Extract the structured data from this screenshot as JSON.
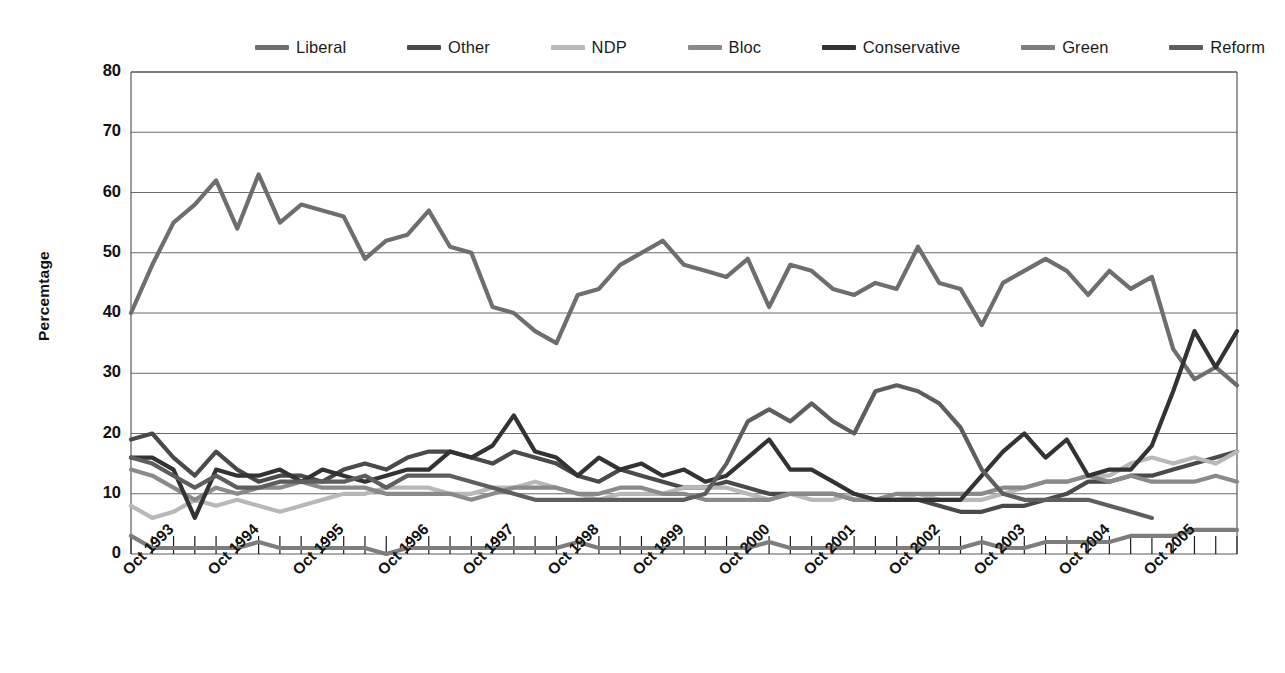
{
  "legend": {
    "position": "top",
    "items": [
      {
        "label": "Liberal",
        "color": "#6e6e6e"
      },
      {
        "label": "Other",
        "color": "#4a4a4a"
      },
      {
        "label": "NDP",
        "color": "#b8b8b8"
      },
      {
        "label": "Bloc",
        "color": "#8a8a8a"
      },
      {
        "label": "Conservative",
        "color": "#333333"
      },
      {
        "label": "Green",
        "color": "#7d7d7d"
      },
      {
        "label": "Reform",
        "color": "#5e5e5e"
      }
    ]
  },
  "axes": {
    "y_title": "Percemtage",
    "y_ticks": [
      "0",
      "10",
      "20",
      "30",
      "40",
      "50",
      "60",
      "70",
      "80"
    ],
    "x_ticks": [
      "Oct 1993",
      "Oct 1994",
      "Oct 1995",
      "Oct 1996",
      "Oct 1997",
      "Oct 1998",
      "Oct 1999",
      "Oct 2000",
      "Oct 2001",
      "Oct 2002",
      "Oct 2003",
      "Oct 2004",
      "Oct 2005"
    ]
  },
  "chart_data": {
    "type": "line",
    "title": "",
    "xlabel": "",
    "ylabel": "Percemtage",
    "ylim": [
      0,
      80
    ],
    "ytick_step": 10,
    "grid": true,
    "legend_position": "top",
    "x_tick_labels": [
      "Oct 1993",
      "Oct 1994",
      "Oct 1995",
      "Oct 1996",
      "Oct 1997",
      "Oct 1998",
      "Oct 1999",
      "Oct 2000",
      "Oct 2001",
      "Oct 2002",
      "Oct 2003",
      "Oct 2004",
      "Oct 2005"
    ],
    "x_sample_interval": "quarterly",
    "x_count": 53,
    "series": [
      {
        "name": "Liberal",
        "color": "#6e6e6e",
        "values": [
          40,
          48,
          55,
          58,
          62,
          54,
          63,
          55,
          58,
          57,
          56,
          49,
          52,
          53,
          57,
          51,
          50,
          41,
          40,
          37,
          35,
          43,
          44,
          48,
          50,
          52,
          48,
          47,
          46,
          49,
          41,
          48,
          47,
          44,
          43,
          45,
          44,
          51,
          45,
          44,
          38,
          45,
          47,
          49,
          47,
          43,
          47,
          44,
          46,
          34,
          29,
          31,
          28
        ]
      },
      {
        "name": "Other",
        "color": "#4a4a4a",
        "values": [
          19,
          20,
          16,
          13,
          17,
          14,
          12,
          13,
          13,
          12,
          14,
          15,
          14,
          16,
          17,
          17,
          16,
          15,
          17,
          16,
          15,
          13,
          12,
          14,
          13,
          12,
          11,
          11,
          12,
          11,
          10,
          10,
          10,
          10,
          9,
          9,
          9,
          9,
          8,
          7,
          7,
          8,
          8,
          9,
          10,
          12,
          12,
          13,
          13,
          14,
          15,
          16,
          17
        ]
      },
      {
        "name": "NDP",
        "color": "#b8b8b8",
        "values": [
          8,
          6,
          7,
          9,
          8,
          9,
          8,
          7,
          8,
          9,
          10,
          10,
          11,
          11,
          11,
          10,
          10,
          11,
          11,
          12,
          11,
          10,
          9,
          10,
          10,
          10,
          11,
          11,
          11,
          10,
          9,
          10,
          9,
          9,
          10,
          9,
          9,
          10,
          9,
          9,
          9,
          10,
          11,
          12,
          12,
          13,
          13,
          15,
          16,
          15,
          16,
          15,
          17
        ]
      },
      {
        "name": "Bloc",
        "color": "#8a8a8a",
        "values": [
          14,
          13,
          11,
          9,
          11,
          10,
          11,
          11,
          12,
          11,
          11,
          11,
          10,
          10,
          10,
          10,
          9,
          10,
          11,
          11,
          11,
          10,
          10,
          11,
          11,
          10,
          10,
          9,
          9,
          9,
          9,
          10,
          10,
          10,
          9,
          9,
          10,
          10,
          10,
          10,
          10,
          11,
          11,
          12,
          12,
          13,
          12,
          13,
          12,
          12,
          12,
          13,
          12
        ]
      },
      {
        "name": "Conservative",
        "color": "#333333",
        "values": [
          16,
          16,
          14,
          6,
          14,
          13,
          13,
          14,
          12,
          14,
          13,
          12,
          13,
          14,
          14,
          17,
          16,
          18,
          23,
          17,
          16,
          13,
          16,
          14,
          15,
          13,
          14,
          12,
          13,
          16,
          19,
          14,
          14,
          12,
          10,
          9,
          9,
          9,
          9,
          9,
          13,
          17,
          20,
          16,
          19,
          13,
          14,
          14,
          18,
          27,
          37,
          31,
          37
        ]
      },
      {
        "name": "Green",
        "color": "#7d7d7d",
        "values": [
          3,
          1,
          1,
          1,
          1,
          1,
          2,
          1,
          1,
          1,
          1,
          1,
          0,
          1,
          1,
          1,
          1,
          1,
          1,
          1,
          1,
          2,
          1,
          1,
          1,
          1,
          1,
          1,
          1,
          1,
          2,
          1,
          1,
          1,
          1,
          1,
          1,
          1,
          1,
          1,
          2,
          1,
          1,
          2,
          2,
          2,
          2,
          3,
          3,
          3,
          4,
          4,
          4
        ]
      },
      {
        "name": "Reform",
        "color": "#5e5e5e",
        "values": [
          16,
          15,
          13,
          11,
          13,
          11,
          11,
          12,
          12,
          12,
          12,
          13,
          11,
          13,
          13,
          13,
          12,
          11,
          10,
          9,
          9,
          9,
          9,
          9,
          9,
          9,
          9,
          10,
          15,
          22,
          24,
          22,
          25,
          22,
          20,
          27,
          28,
          27,
          25,
          21,
          14,
          10,
          9,
          9,
          9,
          9,
          8,
          7,
          6,
          null,
          null,
          null,
          null
        ]
      }
    ]
  },
  "geometry": {
    "plot_left": 131,
    "plot_right": 1237,
    "plot_top": 72,
    "plot_bottom": 554
  }
}
